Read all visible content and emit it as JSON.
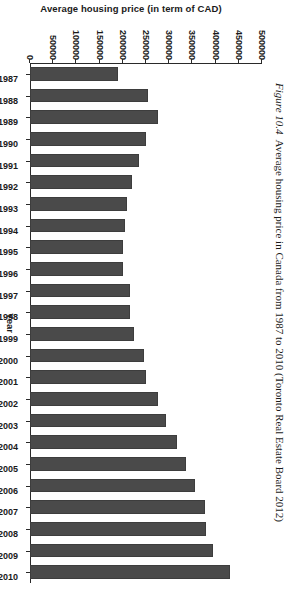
{
  "caption": {
    "label": "Figure 10.4",
    "text": "Average housing price in Canada from 1987 to 2010 (Toronto Real Estate Board 2012)"
  },
  "chart_data": {
    "type": "bar",
    "title": "",
    "xlabel": "Year",
    "ylabel": "Average housing price (in term of CAD)",
    "orientation": "vertical",
    "grid": false,
    "legend": "none",
    "ylim": [
      0,
      500000
    ],
    "yticks": [
      0,
      50000,
      100000,
      150000,
      200000,
      250000,
      300000,
      350000,
      400000,
      450000,
      500000
    ],
    "ytick_labels": [
      "0",
      "50000",
      "100000",
      "150000",
      "200000",
      "250000",
      "300000",
      "350000",
      "400000",
      "450000",
      "500000"
    ],
    "categories": [
      "1987",
      "1988",
      "1989",
      "1990",
      "1991",
      "1992",
      "1993",
      "1994",
      "1995",
      "1996",
      "1997",
      "1998",
      "1999",
      "2000",
      "2001",
      "2002",
      "2003",
      "2004",
      "2005",
      "2006",
      "2007",
      "2008",
      "2009",
      "2010"
    ],
    "values": [
      190000,
      255000,
      275000,
      250000,
      235000,
      220000,
      210000,
      205000,
      200000,
      200000,
      215000,
      215000,
      225000,
      245000,
      251000,
      275000,
      293000,
      316000,
      336000,
      355000,
      377000,
      380000,
      395000,
      430000
    ],
    "bar_color": "#4a4a4a",
    "axis_color": "#2a2a2a"
  }
}
